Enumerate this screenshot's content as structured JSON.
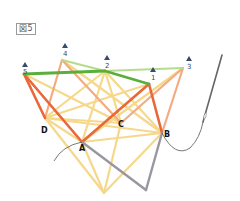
{
  "figure": {
    "label": "図5"
  },
  "pins": [
    {
      "id": "1",
      "label": "1"
    },
    {
      "id": "2",
      "label": "2"
    },
    {
      "id": "3",
      "label": "3"
    },
    {
      "id": "4",
      "label": "4"
    },
    {
      "id": "5",
      "label": "5"
    }
  ],
  "points": [
    {
      "id": "A",
      "label": "A"
    },
    {
      "id": "B",
      "label": "B"
    },
    {
      "id": "C",
      "label": "C"
    },
    {
      "id": "D",
      "label": "D"
    }
  ],
  "colors": {
    "green_dark": "#5aae3c",
    "green_light": "#b5dc8a",
    "orange_dark": "#e8683a",
    "orange_light": "#f3ab82",
    "yellow": "#f6d88a",
    "gray": "#9a96a0",
    "thread": "#555555",
    "pin": "#3a4a6a"
  }
}
